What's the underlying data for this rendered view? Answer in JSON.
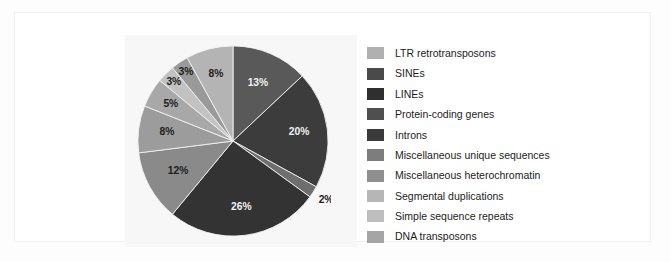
{
  "figure": {
    "background_color": "#fdfdfd",
    "panel_color": "#f7f7f7",
    "frame_border_color": "#f0f0f0"
  },
  "chart_data": {
    "type": "pie",
    "title": "",
    "subtitle": "",
    "xlabel": "",
    "ylabel": "",
    "grid": false,
    "legend_position": "right",
    "units": "percent",
    "start_angle_deg": 0,
    "direction": "clockwise",
    "total": 100,
    "categories": [
      "LTR retrotransposons",
      "SINEs",
      "LINEs",
      "Protein-coding genes",
      "Introns",
      "Miscellaneous unique sequences",
      "Miscellaneous heterochromatin",
      "Segmental duplications",
      "Simple sequence repeats",
      "DNA transposons"
    ],
    "values": [
      13,
      20,
      2,
      26,
      12,
      8,
      5,
      3,
      3,
      8
    ],
    "value_labels": [
      "13%",
      "20%",
      "2%",
      "26%",
      "12%",
      "8%",
      "5%",
      "3%",
      "3%",
      "8%"
    ],
    "colors": [
      "#595959",
      "#3c3c3c",
      "#6e6e6e",
      "#333333",
      "#8a8a8a",
      "#9c9c9c",
      "#a8a8a8",
      "#c2c2c2",
      "#9a9a9a",
      "#b4b4b4"
    ],
    "label_text_colors": [
      "#f2f2f2",
      "#f2f2f2",
      "#1c1c1c",
      "#f2f2f2",
      "#1c1c1c",
      "#1c1c1c",
      "#1c1c1c",
      "#1c1c1c",
      "#1c1c1c",
      "#1c1c1c"
    ],
    "label_radius_frac": [
      0.66,
      0.7,
      1.16,
      0.7,
      0.66,
      0.7,
      0.76,
      0.88,
      0.88,
      0.72
    ],
    "slices": [
      {
        "label": "LTR retrotransposons",
        "value": 13,
        "value_label": "13%",
        "color": "#595959"
      },
      {
        "label": "SINEs",
        "value": 20,
        "value_label": "20%",
        "color": "#3c3c3c"
      },
      {
        "label": "LINEs",
        "value": 2,
        "value_label": "2%",
        "color": "#6e6e6e"
      },
      {
        "label": "Protein-coding genes",
        "value": 26,
        "value_label": "26%",
        "color": "#333333"
      },
      {
        "label": "Introns",
        "value": 12,
        "value_label": "12%",
        "color": "#8a8a8a"
      },
      {
        "label": "Miscellaneous unique sequences",
        "value": 8,
        "value_label": "8%",
        "color": "#9c9c9c"
      },
      {
        "label": "Miscellaneous heterochromatin",
        "value": 5,
        "value_label": "5%",
        "color": "#a8a8a8"
      },
      {
        "label": "Segmental duplications",
        "value": 3,
        "value_label": "3%",
        "color": "#c2c2c2"
      },
      {
        "label": "Simple sequence repeats",
        "value": 3,
        "value_label": "3%",
        "color": "#9a9a9a"
      },
      {
        "label": "DNA transposons",
        "value": 8,
        "value_label": "8%",
        "color": "#b4b4b4"
      }
    ]
  },
  "legend": {
    "items": [
      {
        "label": "LTR retrotransposons",
        "color": "#b0b0b0"
      },
      {
        "label": "SINEs",
        "color": "#4a4a4a"
      },
      {
        "label": "LINEs",
        "color": "#2f2f2f"
      },
      {
        "label": "Protein-coding genes",
        "color": "#4f4f4f"
      },
      {
        "label": "Introns",
        "color": "#3a3a3a"
      },
      {
        "label": "Miscellaneous unique sequences",
        "color": "#7d7d7d"
      },
      {
        "label": "Miscellaneous heterochromatin",
        "color": "#8f8f8f"
      },
      {
        "label": "Segmental duplications",
        "color": "#b6b6b6"
      },
      {
        "label": "Simple sequence repeats",
        "color": "#bdbdbd"
      },
      {
        "label": "DNA transposons",
        "color": "#a5a5a5"
      }
    ]
  }
}
